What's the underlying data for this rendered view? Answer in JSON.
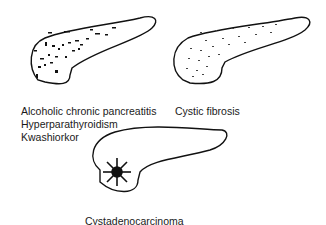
{
  "panels": [
    {
      "id": "calcification",
      "labels": [
        "Alcoholic chronic pancreatitis",
        "Hyperparathyroidism",
        "Kwashiorkor"
      ],
      "pattern": "coarse calcification specks"
    },
    {
      "id": "cystic-fibrosis",
      "labels": [
        "Cystic fibrosis"
      ],
      "pattern": "fine stippled calcification"
    },
    {
      "id": "cystadenocarcinoma",
      "labels": [
        "Cystadenocarcinoma"
      ],
      "pattern": "central sunburst calcification"
    }
  ]
}
